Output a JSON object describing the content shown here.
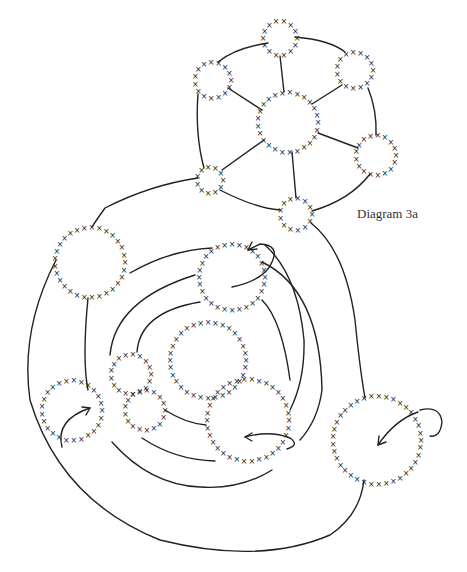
{
  "diagram": {
    "caption": "Diagram 3a",
    "header_fragment": "",
    "stitch_symbol": "×",
    "ink_color": "#222222",
    "circles": [
      {
        "id": "top",
        "cx": 280,
        "cy": 38,
        "r": 17
      },
      {
        "id": "upper-left",
        "cx": 213,
        "cy": 80,
        "r": 18
      },
      {
        "id": "upper-right",
        "cx": 355,
        "cy": 70,
        "r": 18
      },
      {
        "id": "center-hub",
        "cx": 288,
        "cy": 122,
        "r": 30
      },
      {
        "id": "right",
        "cx": 376,
        "cy": 155,
        "r": 20
      },
      {
        "id": "lower-left",
        "cx": 210,
        "cy": 180,
        "r": 13
      },
      {
        "id": "lower-mid",
        "cx": 296,
        "cy": 214,
        "r": 16
      },
      {
        "id": "big-left",
        "cx": 90,
        "cy": 262,
        "r": 35
      },
      {
        "id": "upper-inner",
        "cx": 232,
        "cy": 277,
        "r": 33
      },
      {
        "id": "center-big",
        "cx": 208,
        "cy": 360,
        "r": 38
      },
      {
        "id": "small-left-a",
        "cx": 131,
        "cy": 374,
        "r": 20
      },
      {
        "id": "small-left-b",
        "cx": 145,
        "cy": 410,
        "r": 20
      },
      {
        "id": "left-outer",
        "cx": 72,
        "cy": 410,
        "r": 30
      },
      {
        "id": "bottom-right-inner",
        "cx": 248,
        "cy": 420,
        "r": 41
      },
      {
        "id": "far-right",
        "cx": 377,
        "cy": 440,
        "r": 44
      }
    ]
  }
}
